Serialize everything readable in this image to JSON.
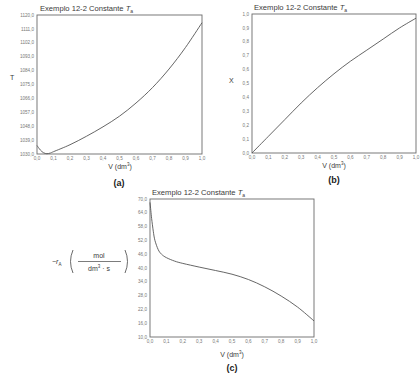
{
  "chart_data": [
    {
      "id": "a",
      "type": "line",
      "title": "Exemplo 12-2 Constante T_a",
      "title_prefix": "Exemplo 12-2 Constante ",
      "title_var": "T",
      "title_sub": "a",
      "xlabel": "V (dm³)",
      "xlabel_main": "V (dm",
      "xlabel_sup": "3",
      "xlabel_close": ")",
      "ylabel": "T",
      "caption": "(a)",
      "xlim": [
        0,
        1
      ],
      "ylim": [
        1030,
        1120
      ],
      "grid": false,
      "xticks": [
        "0,0",
        "0,1",
        "0,2",
        "0,3",
        "0,4",
        "0,5",
        "0,6",
        "0,7",
        "0,8",
        "0,9",
        "1,0"
      ],
      "yticks": [
        "1030,0",
        "1039,0",
        "1048,0",
        "1057,0",
        "1066,0",
        "1075,0",
        "1084,0",
        "1093,0",
        "1102,0",
        "1111,0",
        "1120,0"
      ],
      "x": [
        0,
        0.02,
        0.04,
        0.06,
        0.08,
        0.1,
        0.2,
        0.3,
        0.4,
        0.5,
        0.6,
        0.7,
        0.8,
        0.9,
        1.0
      ],
      "y": [
        1035.5,
        1032.6,
        1030.8,
        1030.2,
        1030.6,
        1031.5,
        1036.0,
        1041.5,
        1047.6,
        1054.5,
        1063.0,
        1073.0,
        1085.0,
        1099.0,
        1115.0
      ]
    },
    {
      "id": "b",
      "type": "line",
      "title": "Exemplo 12-2 Constante T_a",
      "title_prefix": "Exemplo 12-2 Constante ",
      "title_var": "T",
      "title_sub": "a",
      "xlabel": "V (dm³)",
      "xlabel_main": "V (dm",
      "xlabel_sup": "3",
      "xlabel_close": ")",
      "ylabel": "X",
      "caption": "(b)",
      "xlim": [
        0,
        1
      ],
      "ylim": [
        0,
        1
      ],
      "grid": false,
      "xticks": [
        "0,0",
        "0,1",
        "0,2",
        "0,3",
        "0,4",
        "0,5",
        "0,6",
        "0,7",
        "0,8",
        "0,9",
        "1,0"
      ],
      "yticks": [
        "0,0",
        "0,1",
        "0,2",
        "0,3",
        "0,4",
        "0,5",
        "0,6",
        "0,7",
        "0,8",
        "0,9",
        "1,0"
      ],
      "x": [
        0,
        0.1,
        0.2,
        0.3,
        0.4,
        0.5,
        0.6,
        0.7,
        0.8,
        0.9,
        1.0
      ],
      "y": [
        0,
        0.12,
        0.24,
        0.36,
        0.47,
        0.57,
        0.66,
        0.74,
        0.82,
        0.9,
        0.97
      ]
    },
    {
      "id": "c",
      "type": "line",
      "title": "Exemplo 12-2 Constante T_a",
      "title_prefix": "Exemplo 12-2 Constante ",
      "title_var": "T",
      "title_sub": "a",
      "xlabel": "V (dm³)",
      "xlabel_main": "V (dm",
      "xlabel_sup": "3",
      "xlabel_close": ")",
      "ylabel": "−r_A (mol / (dm³·s))",
      "ylabel_minus": "−",
      "ylabel_var": "r",
      "ylabel_sub": "A",
      "ylabel_num": "mol",
      "ylabel_den_main": "dm",
      "ylabel_den_sup": "3",
      "ylabel_den_rest": " · s",
      "caption": "(c)",
      "xlim": [
        0,
        1
      ],
      "ylim": [
        10,
        70
      ],
      "grid": false,
      "xticks": [
        "0,0",
        "0,1",
        "0,2",
        "0,3",
        "0,4",
        "0,5",
        "0,6",
        "0,7",
        "0,8",
        "0,9",
        "1,0"
      ],
      "yticks": [
        "10,0",
        "16,0",
        "22,0",
        "28,0",
        "34,0",
        "40,0",
        "46,0",
        "52,0",
        "58,0",
        "64,0",
        "70,0"
      ],
      "x": [
        0,
        0.005,
        0.01,
        0.02,
        0.03,
        0.05,
        0.07,
        0.1,
        0.15,
        0.2,
        0.3,
        0.4,
        0.5,
        0.6,
        0.7,
        0.8,
        0.9,
        1.0
      ],
      "y": [
        68.5,
        65.0,
        61.5,
        56.0,
        52.0,
        48.0,
        46.0,
        44.5,
        43.0,
        42.0,
        40.4,
        38.9,
        37.3,
        35.0,
        31.8,
        27.8,
        23.0,
        17.0
      ]
    }
  ]
}
